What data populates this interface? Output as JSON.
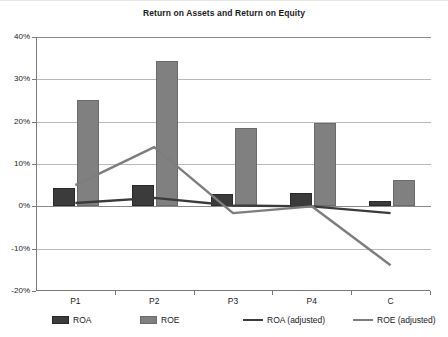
{
  "chart_data": {
    "type": "bar",
    "title": "Return on Assets and Return on Equity",
    "xlabel": "",
    "ylabel": "",
    "categories": [
      "P1",
      "P2",
      "P3",
      "P4",
      "C"
    ],
    "ylim": [
      -20,
      40
    ],
    "ytick_labels": [
      "40%",
      "30%",
      "20%",
      "10%",
      "0%",
      "-10%",
      "-20%"
    ],
    "ytick_values": [
      40,
      30,
      20,
      10,
      0,
      -10,
      -20
    ],
    "grid": true,
    "legend_position": "bottom",
    "series": [
      {
        "name": "ROA",
        "kind": "bar",
        "color": "#3b3b3b",
        "values": [
          4.3,
          5.0,
          2.9,
          3.2,
          1.3
        ]
      },
      {
        "name": "ROE",
        "kind": "bar",
        "color": "#808080",
        "values": [
          25.2,
          34.3,
          18.4,
          19.8,
          6.2
        ]
      },
      {
        "name": "ROA (adjusted)",
        "kind": "line",
        "color": "#3b3b3b",
        "values": [
          0.8,
          2.0,
          0.2,
          0.0,
          -1.6
        ]
      },
      {
        "name": "ROE (adjusted)",
        "kind": "line",
        "color": "#7d7d7d",
        "values": [
          5.0,
          14.0,
          -1.6,
          0.0,
          -13.9
        ]
      }
    ]
  },
  "legend": {
    "items": [
      {
        "label": "ROA",
        "marker": "box",
        "color": "#3b3b3b"
      },
      {
        "label": "ROE",
        "marker": "box",
        "color": "#808080"
      },
      {
        "label": "ROA (adjusted)",
        "marker": "line",
        "color": "#3b3b3b"
      },
      {
        "label": "ROE (adjusted)",
        "marker": "line",
        "color": "#7d7d7d"
      }
    ]
  }
}
